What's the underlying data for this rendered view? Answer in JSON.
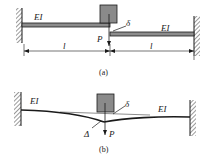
{
  "figure_a": {
    "caption": "(a)",
    "left_beam_label": "EI",
    "right_beam_label": "EI",
    "load_label": "P",
    "gap_label": "δ",
    "left_span_label": "l",
    "right_span_label": "l"
  },
  "figure_b": {
    "caption": "(b)",
    "left_beam_label": "EI",
    "right_beam_label": "EI",
    "load_label": "P",
    "gap_label": "δ",
    "deflection_label": "Δ"
  },
  "colors": {
    "ink": "#1a1a1a",
    "beam_fill": "#8c8c8c",
    "block_fill": "#8a8a8a",
    "hatch": "#555555"
  }
}
